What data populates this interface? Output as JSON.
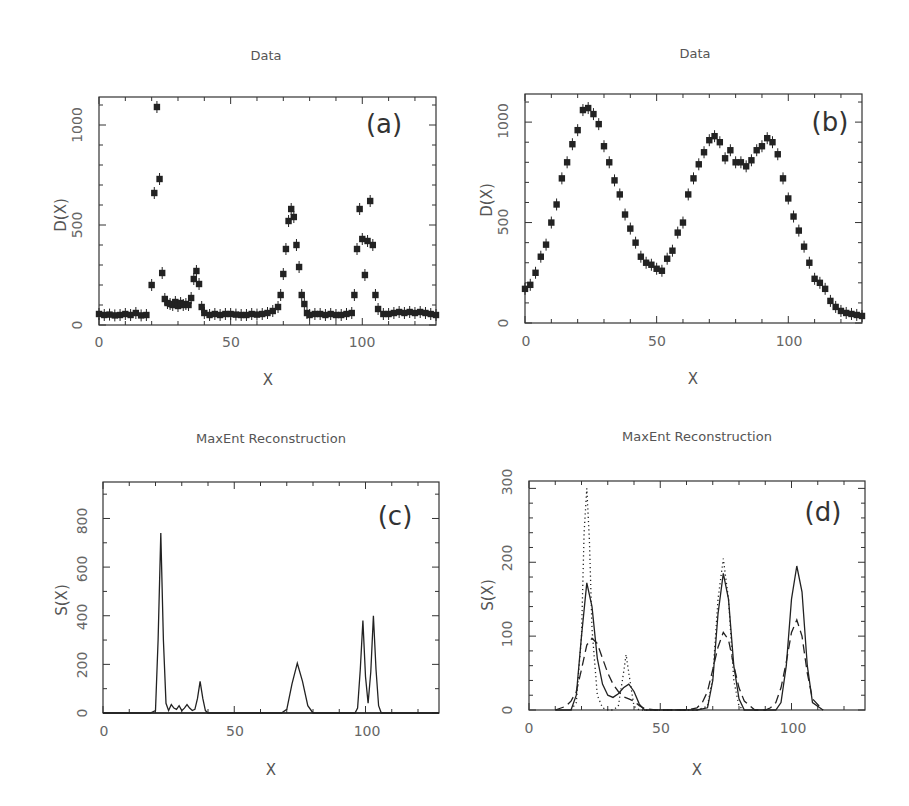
{
  "chart_data": [
    {
      "panel": "(a)",
      "type": "scatter",
      "title": "Data",
      "xlabel": "X",
      "ylabel": "D(X)",
      "xlim": [
        0,
        128
      ],
      "ylim": [
        0,
        1140
      ],
      "xticks": [
        0,
        50,
        100
      ],
      "yticks": [
        0,
        500,
        1000
      ],
      "grid": false,
      "marker": "filled square with error bars",
      "x": [
        0,
        2,
        4,
        6,
        8,
        10,
        12,
        14,
        16,
        18,
        20,
        21,
        22,
        23,
        24,
        25,
        26,
        27,
        28,
        29,
        30,
        31,
        32,
        33,
        34,
        35,
        36,
        37,
        38,
        39,
        40,
        42,
        44,
        46,
        48,
        50,
        52,
        54,
        56,
        58,
        60,
        62,
        64,
        66,
        68,
        69,
        70,
        71,
        72,
        73,
        74,
        75,
        76,
        77,
        78,
        79,
        80,
        82,
        84,
        86,
        88,
        90,
        92,
        94,
        96,
        97,
        98,
        99,
        100,
        101,
        102,
        103,
        104,
        105,
        106,
        108,
        110,
        112,
        114,
        116,
        118,
        120,
        122,
        124,
        126,
        128
      ],
      "y": [
        55,
        50,
        52,
        48,
        50,
        55,
        50,
        60,
        48,
        50,
        200,
        660,
        1090,
        730,
        260,
        130,
        110,
        105,
        100,
        115,
        95,
        110,
        100,
        105,
        100,
        135,
        230,
        270,
        205,
        90,
        60,
        50,
        55,
        50,
        55,
        55,
        52,
        50,
        50,
        55,
        52,
        55,
        60,
        70,
        90,
        150,
        255,
        380,
        520,
        580,
        540,
        400,
        290,
        150,
        105,
        60,
        50,
        55,
        55,
        50,
        55,
        50,
        50,
        55,
        60,
        150,
        380,
        580,
        430,
        250,
        420,
        620,
        400,
        150,
        80,
        55,
        55,
        60,
        65,
        60,
        65,
        60,
        65,
        60,
        55,
        50
      ]
    },
    {
      "panel": "(b)",
      "type": "scatter",
      "title": "Data",
      "xlabel": "X",
      "ylabel": "D(X)",
      "xlim": [
        0,
        128
      ],
      "ylim": [
        0,
        1140
      ],
      "xticks": [
        0,
        50,
        100
      ],
      "yticks": [
        0,
        500,
        1000
      ],
      "grid": false,
      "marker": "filled square with error bars",
      "x": [
        0,
        2,
        4,
        6,
        8,
        10,
        12,
        14,
        16,
        18,
        20,
        22,
        24,
        26,
        28,
        30,
        32,
        34,
        36,
        38,
        40,
        42,
        44,
        46,
        48,
        50,
        52,
        54,
        56,
        58,
        60,
        62,
        64,
        66,
        68,
        70,
        72,
        74,
        76,
        78,
        80,
        82,
        84,
        86,
        88,
        90,
        92,
        94,
        96,
        98,
        100,
        102,
        104,
        106,
        108,
        110,
        112,
        114,
        116,
        118,
        120,
        122,
        124,
        126,
        128
      ],
      "y": [
        170,
        190,
        250,
        330,
        390,
        500,
        590,
        720,
        800,
        890,
        960,
        1060,
        1070,
        1040,
        990,
        880,
        800,
        710,
        640,
        540,
        470,
        400,
        330,
        300,
        290,
        270,
        260,
        320,
        360,
        450,
        500,
        640,
        720,
        790,
        850,
        910,
        930,
        900,
        820,
        860,
        800,
        800,
        780,
        810,
        860,
        880,
        920,
        900,
        840,
        720,
        620,
        530,
        460,
        380,
        300,
        220,
        200,
        170,
        110,
        80,
        60,
        50,
        45,
        40,
        35
      ]
    },
    {
      "panel": "(c)",
      "type": "line",
      "title": "MaxEnt Reconstruction",
      "xlabel": "X",
      "ylabel": "S(X)",
      "xlim": [
        0,
        128
      ],
      "ylim": [
        0,
        950
      ],
      "xticks": [
        0,
        50,
        100
      ],
      "yticks": [
        0,
        200,
        400,
        600,
        800
      ],
      "grid": false,
      "x": [
        0,
        18,
        20,
        21,
        22,
        23,
        24,
        25,
        26,
        27,
        28,
        29,
        30,
        31,
        32,
        33,
        34,
        35,
        36,
        37,
        38,
        39,
        40,
        50,
        68,
        70,
        72,
        74,
        76,
        78,
        80,
        96,
        97,
        98,
        99,
        100,
        101,
        102,
        103,
        104,
        105,
        106,
        128
      ],
      "y": [
        0,
        0,
        10,
        300,
        740,
        300,
        40,
        10,
        35,
        20,
        15,
        30,
        10,
        20,
        35,
        20,
        10,
        15,
        60,
        130,
        60,
        10,
        0,
        0,
        0,
        15,
        120,
        205,
        130,
        30,
        0,
        0,
        20,
        180,
        380,
        150,
        40,
        170,
        400,
        180,
        30,
        0,
        0
      ]
    },
    {
      "panel": "(d)",
      "type": "line",
      "title": "MaxEnt Reconstruction",
      "xlabel": "X",
      "ylabel": "S(X)",
      "xlim": [
        0,
        128
      ],
      "ylim": [
        0,
        310
      ],
      "xticks": [
        0,
        50,
        100
      ],
      "yticks": [
        0,
        100,
        200,
        300
      ],
      "grid": false,
      "series": [
        {
          "name": "solid",
          "style": "solid",
          "x": [
            10,
            16,
            18,
            20,
            22,
            24,
            26,
            28,
            30,
            32,
            34,
            36,
            38,
            40,
            42,
            44,
            48,
            64,
            68,
            70,
            72,
            74,
            76,
            78,
            80,
            82,
            90,
            94,
            96,
            98,
            100,
            102,
            104,
            106,
            108,
            112
          ],
          "y": [
            0,
            0,
            20,
            100,
            172,
            140,
            70,
            35,
            20,
            17,
            22,
            30,
            35,
            25,
            8,
            0,
            0,
            0,
            3,
            40,
            130,
            185,
            150,
            60,
            15,
            0,
            0,
            0,
            10,
            60,
            150,
            195,
            160,
            60,
            10,
            0
          ]
        },
        {
          "name": "dashed",
          "style": "dashed",
          "x": [
            10,
            14,
            16,
            18,
            20,
            22,
            24,
            26,
            28,
            30,
            32,
            34,
            36,
            38,
            40,
            42,
            44,
            48,
            60,
            64,
            66,
            68,
            70,
            72,
            74,
            76,
            78,
            80,
            82,
            86,
            90,
            92,
            94,
            96,
            98,
            100,
            102,
            104,
            106,
            108,
            112
          ],
          "y": [
            0,
            5,
            12,
            25,
            55,
            88,
            97,
            90,
            70,
            50,
            35,
            25,
            18,
            15,
            12,
            6,
            2,
            0,
            0,
            3,
            10,
            25,
            55,
            85,
            105,
            95,
            60,
            30,
            12,
            0,
            0,
            3,
            10,
            30,
            65,
            105,
            122,
            100,
            50,
            15,
            0
          ]
        },
        {
          "name": "dotted",
          "style": "dotted",
          "x": [
            16,
            18,
            20,
            21,
            22,
            23,
            24,
            26,
            28,
            30,
            32,
            34,
            36,
            37,
            38,
            40,
            42,
            44,
            64,
            68,
            70,
            72,
            74,
            76,
            78,
            80,
            82
          ],
          "y": [
            0,
            10,
            100,
            240,
            300,
            230,
            110,
            20,
            3,
            0,
            0,
            5,
            50,
            75,
            50,
            5,
            0,
            0,
            0,
            5,
            45,
            150,
            205,
            150,
            40,
            5,
            0
          ]
        }
      ]
    }
  ],
  "panels": {
    "a": {
      "title": "Data",
      "label": "(a)",
      "ylabel": "D(X)",
      "xlabel": "X",
      "xticks": [
        "0",
        "50",
        "100"
      ],
      "yticks": [
        "0",
        "500",
        "1000"
      ]
    },
    "b": {
      "title": "Data",
      "label": "(b)",
      "ylabel": "D(X)",
      "xlabel": "X",
      "xticks": [
        "0",
        "50",
        "100"
      ],
      "yticks": [
        "0",
        "500",
        "1000"
      ]
    },
    "c": {
      "title": "MaxEnt Reconstruction",
      "label": "(c)",
      "ylabel": "S(X)",
      "xlabel": "X",
      "xticks": [
        "0",
        "50",
        "100"
      ],
      "yticks": [
        "0",
        "200",
        "400",
        "600",
        "800"
      ]
    },
    "d": {
      "title": "MaxEnt Reconstruction",
      "label": "(d)",
      "ylabel": "S(X)",
      "xlabel": "X",
      "xticks": [
        "0",
        "50",
        "100"
      ],
      "yticks": [
        "0",
        "100",
        "200",
        "300"
      ]
    }
  }
}
